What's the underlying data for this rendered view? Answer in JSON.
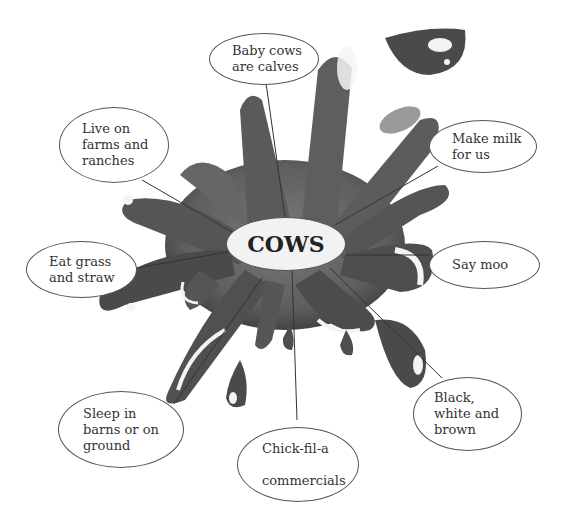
{
  "diagram": {
    "type": "mind-map",
    "center": {
      "label": "COWS"
    },
    "nodes": [
      {
        "id": "baby",
        "label": "Baby cows\nare calves"
      },
      {
        "id": "live",
        "label": "Live on\nfarms and\nranches"
      },
      {
        "id": "milk",
        "label": "Make milk\nfor us"
      },
      {
        "id": "moo",
        "label": "Say moo"
      },
      {
        "id": "eat",
        "label": "Eat grass\nand straw"
      },
      {
        "id": "sleep",
        "label": "Sleep in\nbarns or on\nground"
      },
      {
        "id": "chick",
        "label": "Chick-fil-a\n\ncommercials"
      },
      {
        "id": "color",
        "label": "Black,\nwhite and\nbrown"
      }
    ]
  },
  "colors": {
    "splash_dark": "#3a3a3a",
    "splash_mid": "#6a6a6a",
    "splash_light": "#9a9a9a",
    "highlight": "#f4f4f4",
    "line": "#333333"
  }
}
